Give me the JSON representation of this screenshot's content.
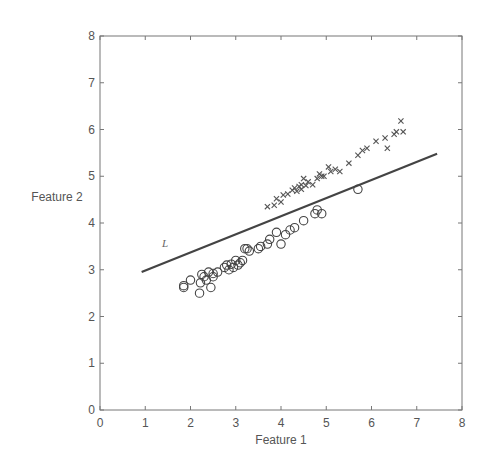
{
  "chart_data": {
    "type": "scatter",
    "title": "",
    "xlabel": "Feature 1",
    "ylabel": "Feature 2",
    "xlim": [
      0,
      8
    ],
    "ylim": [
      0,
      8
    ],
    "xticks": [
      0,
      1,
      2,
      3,
      4,
      5,
      6,
      7,
      8
    ],
    "yticks": [
      0,
      1,
      2,
      3,
      4,
      5,
      6,
      7,
      8
    ],
    "grid": false,
    "legend": null,
    "series": [
      {
        "name": "class-circle",
        "marker": "circle",
        "points": [
          [
            1.85,
            2.62
          ],
          [
            1.85,
            2.66
          ],
          [
            2.0,
            2.78
          ],
          [
            2.2,
            2.5
          ],
          [
            2.22,
            2.72
          ],
          [
            2.25,
            2.9
          ],
          [
            2.3,
            2.85
          ],
          [
            2.35,
            2.78
          ],
          [
            2.4,
            2.95
          ],
          [
            2.45,
            2.62
          ],
          [
            2.5,
            2.85
          ],
          [
            2.5,
            2.92
          ],
          [
            2.6,
            2.95
          ],
          [
            2.75,
            3.05
          ],
          [
            2.8,
            3.1
          ],
          [
            2.85,
            3.0
          ],
          [
            2.9,
            3.12
          ],
          [
            2.95,
            3.05
          ],
          [
            3.0,
            3.2
          ],
          [
            3.05,
            3.1
          ],
          [
            3.1,
            3.15
          ],
          [
            3.15,
            3.2
          ],
          [
            3.2,
            3.45
          ],
          [
            3.25,
            3.45
          ],
          [
            3.3,
            3.4
          ],
          [
            3.5,
            3.45
          ],
          [
            3.55,
            3.5
          ],
          [
            3.7,
            3.55
          ],
          [
            3.75,
            3.65
          ],
          [
            3.9,
            3.8
          ],
          [
            4.0,
            3.55
          ],
          [
            4.1,
            3.75
          ],
          [
            4.2,
            3.85
          ],
          [
            4.3,
            3.9
          ],
          [
            4.5,
            4.05
          ],
          [
            4.75,
            4.2
          ],
          [
            4.8,
            4.28
          ],
          [
            4.9,
            4.2
          ],
          [
            5.7,
            4.72
          ]
        ]
      },
      {
        "name": "class-x",
        "marker": "x",
        "points": [
          [
            3.7,
            4.35
          ],
          [
            3.85,
            4.38
          ],
          [
            3.9,
            4.52
          ],
          [
            4.0,
            4.45
          ],
          [
            4.05,
            4.6
          ],
          [
            4.15,
            4.62
          ],
          [
            4.25,
            4.7
          ],
          [
            4.3,
            4.75
          ],
          [
            4.35,
            4.68
          ],
          [
            4.4,
            4.78
          ],
          [
            4.45,
            4.82
          ],
          [
            4.45,
            4.72
          ],
          [
            4.5,
            4.95
          ],
          [
            4.55,
            4.8
          ],
          [
            4.6,
            4.88
          ],
          [
            4.7,
            4.82
          ],
          [
            4.8,
            4.95
          ],
          [
            4.85,
            5.05
          ],
          [
            4.9,
            5.0
          ],
          [
            4.95,
            5.0
          ],
          [
            5.05,
            5.2
          ],
          [
            5.1,
            5.1
          ],
          [
            5.2,
            5.15
          ],
          [
            5.3,
            5.1
          ],
          [
            5.5,
            5.28
          ],
          [
            5.7,
            5.45
          ],
          [
            5.8,
            5.55
          ],
          [
            5.9,
            5.6
          ],
          [
            6.1,
            5.75
          ],
          [
            6.3,
            5.82
          ],
          [
            6.35,
            5.6
          ],
          [
            6.5,
            5.9
          ],
          [
            6.55,
            5.95
          ],
          [
            6.65,
            6.18
          ],
          [
            6.7,
            5.95
          ]
        ]
      }
    ],
    "lines": [
      {
        "name": "L",
        "x": [
          0.92,
          7.45
        ],
        "y": [
          2.95,
          5.48
        ]
      }
    ],
    "annotations": [
      {
        "text": "L",
        "x": 1.4,
        "y": 3.55
      }
    ]
  },
  "labels": {
    "xlabel": "Feature 1",
    "ylabel": "Feature 2",
    "line_label": "L"
  }
}
